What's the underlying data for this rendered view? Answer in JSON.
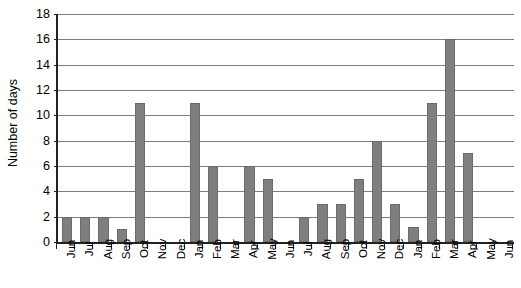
{
  "chart_data": {
    "type": "bar",
    "title": "",
    "xlabel": "",
    "ylabel": "Number of days",
    "ylim": [
      0,
      18
    ],
    "ytick_step": 2,
    "yticks": [
      0,
      2,
      4,
      6,
      8,
      10,
      12,
      14,
      16,
      18
    ],
    "grid": true,
    "legend": "none",
    "bar_color": "#7f7f7f",
    "axis_color": "#222222",
    "gridline_color": "#7d7d7d",
    "categories": [
      "Jun",
      "Jul",
      "Aug",
      "Sep",
      "Oct",
      "Nov",
      "Dec",
      "Jan",
      "Feb",
      "Mar",
      "Apr",
      "May",
      "Jun",
      "Jul",
      "Aug",
      "Sep",
      "Oct",
      "Nov",
      "Dec",
      "Jan",
      "Feb",
      "Mar",
      "Apr",
      "May",
      "Jun"
    ],
    "values": [
      2,
      2,
      2,
      1,
      11,
      0,
      0,
      11,
      6,
      0,
      6,
      5,
      0,
      2,
      3,
      3,
      5,
      8,
      3,
      1.2,
      11,
      16,
      7,
      0,
      0
    ]
  }
}
